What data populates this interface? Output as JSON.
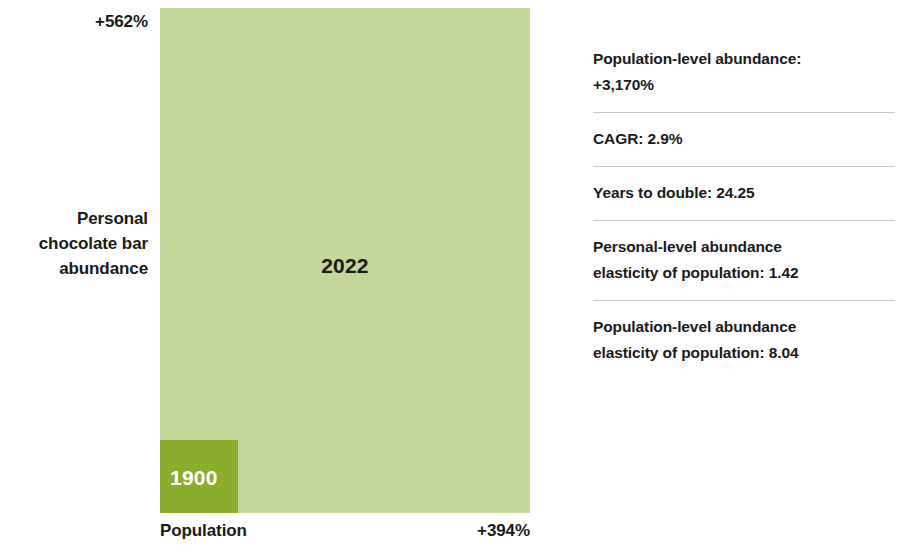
{
  "chart_data": {
    "type": "bar",
    "title": "",
    "subtitle": "",
    "xlabel": "Population",
    "ylabel": "Personal chocolate bar abundance",
    "x_axis_end_label": "+394%",
    "y_axis_end_label": "+562%",
    "grid": false,
    "legend": "none",
    "series": [
      {
        "name": "1900",
        "label": "1900",
        "population_index": 100,
        "abundance_index": 100,
        "color": "#88ac20",
        "width_px": 78,
        "height_px": 73
      },
      {
        "name": "2022",
        "label": "2022",
        "population_index": 494,
        "abundance_index": 662,
        "color": "#c3d794",
        "width_px": 370,
        "height_px": 505
      }
    ],
    "categories": [
      "1900",
      "2022"
    ],
    "annotations": [
      "Population growth 1900 to 2022: +394%",
      "Personal chocolate bar abundance growth 1900 to 2022: +562%"
    ]
  },
  "chart": {
    "outer_rect_label": "2022",
    "inner_rect_label": "1900",
    "y_axis": {
      "top_value": "+562%",
      "title": "Personal\nchocolate bar\nabundance",
      "title_line1": "Personal",
      "title_line2": "chocolate bar",
      "title_line3": "abundance"
    },
    "x_axis": {
      "title": "Population",
      "end_value": "+394%"
    },
    "colors": {
      "outer": "#c3d794",
      "inner": "#88ac20",
      "text": "#1a1a1a",
      "inner_label_text": "#ffffff",
      "divider": "#c9c9c9",
      "background": "#ffffff"
    }
  },
  "stats": {
    "items": [
      {
        "line1": "Population-level abundance:",
        "line2": "+3,170%"
      },
      {
        "line1": "CAGR: 2.9%"
      },
      {
        "line1": "Years to double: 24.25"
      },
      {
        "line1": "Personal-level abundance",
        "line2": "elasticity of population: 1.42"
      },
      {
        "line1": "Population-level abundance",
        "line2": "elasticity of population: 8.04"
      }
    ]
  }
}
